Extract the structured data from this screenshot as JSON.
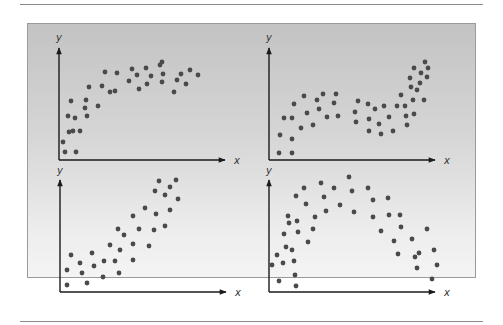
{
  "figure": {
    "background_gradient": [
      "#c3c3c3",
      "#f4f4f4"
    ],
    "dot_color": "#4a4a4a",
    "axis_color": "#1a1a1a",
    "axis_x_label": "x",
    "axis_y_label": "y"
  },
  "chart_data": [
    {
      "type": "scatter",
      "title": "",
      "position": "top-left",
      "pattern": "increasing, concave (logarithmic-like)",
      "xlabel": "x",
      "ylabel": "y",
      "grid": false,
      "xlim": [
        0,
        100
      ],
      "ylim": [
        0,
        100
      ],
      "points": [
        [
          4,
          18
        ],
        [
          6,
          8
        ],
        [
          9,
          44
        ],
        [
          10,
          28
        ],
        [
          12,
          59
        ],
        [
          14,
          29
        ],
        [
          16,
          42
        ],
        [
          17,
          8
        ],
        [
          21,
          29
        ],
        [
          26,
          52
        ],
        [
          27,
          60
        ],
        [
          30,
          73
        ],
        [
          28,
          44
        ],
        [
          39,
          54
        ],
        [
          43,
          74
        ],
        [
          46,
          88
        ],
        [
          51,
          68
        ],
        [
          56,
          69
        ],
        [
          58,
          87
        ],
        [
          70,
          79
        ],
        [
          73,
          91
        ],
        [
          78,
          85
        ],
        [
          80,
          71
        ],
        [
          87,
          92
        ],
        [
          88,
          76
        ],
        [
          92,
          84
        ],
        [
          101,
          95
        ],
        [
          103,
          98
        ],
        [
          103,
          78
        ],
        [
          104,
          86
        ],
        [
          115,
          68
        ],
        [
          118,
          80
        ],
        [
          122,
          86
        ],
        [
          127,
          76
        ],
        [
          131,
          90
        ],
        [
          139,
          85
        ]
      ]
    },
    {
      "type": "scatter",
      "title": "",
      "position": "top-right",
      "pattern": "cubic (rise, plateau, rise)",
      "xlabel": "x",
      "ylabel": "y",
      "grid": false,
      "xlim": [
        0,
        100
      ],
      "ylim": [
        0,
        100
      ],
      "points": [
        [
          10,
          7
        ],
        [
          11,
          25
        ],
        [
          15,
          42
        ],
        [
          23,
          7
        ],
        [
          23,
          21
        ],
        [
          23,
          42
        ],
        [
          25,
          56
        ],
        [
          32,
          32
        ],
        [
          35,
          64
        ],
        [
          38,
          47
        ],
        [
          44,
          35
        ],
        [
          48,
          60
        ],
        [
          50,
          51
        ],
        [
          54,
          66
        ],
        [
          58,
          43
        ],
        [
          65,
          57
        ],
        [
          67,
          66
        ],
        [
          69,
          44
        ],
        [
          86,
          48
        ],
        [
          87,
          38
        ],
        [
          89,
          59
        ],
        [
          99,
          56
        ],
        [
          100,
          41
        ],
        [
          100,
          29
        ],
        [
          106,
          51
        ],
        [
          110,
          36
        ],
        [
          112,
          26
        ],
        [
          115,
          54
        ],
        [
          120,
          43
        ],
        [
          124,
          29
        ],
        [
          128,
          54
        ],
        [
          132,
          65
        ],
        [
          136,
          54
        ],
        [
          137,
          44
        ],
        [
          138,
          35
        ],
        [
          141,
          82
        ],
        [
          142,
          73
        ],
        [
          144,
          60
        ],
        [
          145,
          92
        ],
        [
          145,
          46
        ],
        [
          148,
          70
        ],
        [
          151,
          77
        ],
        [
          152,
          87
        ],
        [
          155,
          60
        ],
        [
          156,
          98
        ],
        [
          158,
          83
        ],
        [
          159,
          92
        ]
      ]
    },
    {
      "type": "scatter",
      "title": "",
      "position": "bottom-left",
      "pattern": "increasing, roughly linear",
      "xlabel": "x",
      "ylabel": "y",
      "grid": false,
      "xlim": [
        0,
        100
      ],
      "ylim": [
        0,
        100
      ],
      "points": [
        [
          7,
          7
        ],
        [
          7,
          22
        ],
        [
          11,
          37
        ],
        [
          20,
          29
        ],
        [
          22,
          19
        ],
        [
          27,
          9
        ],
        [
          32,
          39
        ],
        [
          34,
          26
        ],
        [
          43,
          15
        ],
        [
          44,
          31
        ],
        [
          50,
          47
        ],
        [
          55,
          31
        ],
        [
          59,
          19
        ],
        [
          60,
          42
        ],
        [
          58,
          63
        ],
        [
          64,
          57
        ],
        [
          73,
          32
        ],
        [
          73,
          48
        ],
        [
          73,
          76
        ],
        [
          79,
          63
        ],
        [
          85,
          84
        ],
        [
          89,
          46
        ],
        [
          94,
          62
        ],
        [
          95,
          101
        ],
        [
          96,
          78
        ],
        [
          99,
          111
        ],
        [
          105,
          97
        ],
        [
          105,
          66
        ],
        [
          110,
          105
        ],
        [
          110,
          82
        ],
        [
          116,
          112
        ],
        [
          118,
          93
        ]
      ]
    },
    {
      "type": "scatter",
      "title": "",
      "position": "bottom-right",
      "pattern": "inverted parabola (rise then fall)",
      "xlabel": "x",
      "ylabel": "y",
      "grid": false,
      "xlim": [
        0,
        100
      ],
      "ylim": [
        0,
        100
      ],
      "points": [
        [
          3,
          27
        ],
        [
          8,
          37
        ],
        [
          10,
          11
        ],
        [
          14,
          29
        ],
        [
          15,
          58
        ],
        [
          17,
          45
        ],
        [
          19,
          76
        ],
        [
          20,
          69
        ],
        [
          27,
          6
        ],
        [
          23,
          42
        ],
        [
          25,
          31
        ],
        [
          26,
          17
        ],
        [
          27,
          96
        ],
        [
          28,
          71
        ],
        [
          29,
          60
        ],
        [
          35,
          104
        ],
        [
          37,
          88
        ],
        [
          39,
          50
        ],
        [
          44,
          63
        ],
        [
          46,
          75
        ],
        [
          52,
          109
        ],
        [
          55,
          95
        ],
        [
          57,
          81
        ],
        [
          65,
          104
        ],
        [
          71,
          87
        ],
        [
          80,
          115
        ],
        [
          83,
          101
        ],
        [
          85,
          80
        ],
        [
          99,
          104
        ],
        [
          104,
          92
        ],
        [
          104,
          75
        ],
        [
          112,
          61
        ],
        [
          119,
          94
        ],
        [
          120,
          77
        ],
        [
          125,
          51
        ],
        [
          129,
          38
        ],
        [
          131,
          77
        ],
        [
          132,
          65
        ],
        [
          143,
          53
        ],
        [
          146,
          35
        ],
        [
          148,
          24
        ],
        [
          150,
          39
        ],
        [
          158,
          63
        ],
        [
          163,
          13
        ],
        [
          165,
          42
        ],
        [
          168,
          27
        ]
      ]
    }
  ]
}
